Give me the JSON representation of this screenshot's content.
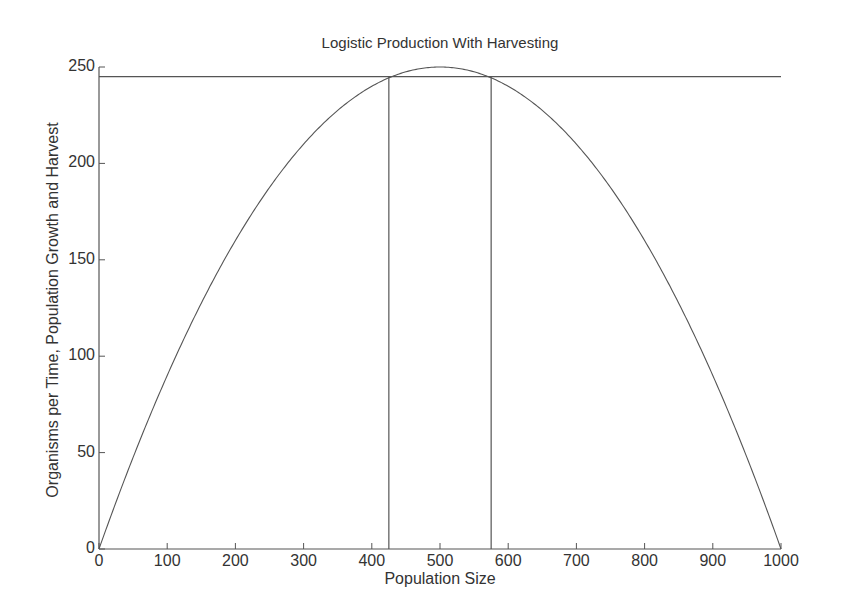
{
  "chart_data": {
    "type": "line",
    "title": "Logistic Production With Harvesting",
    "xlabel": "Population Size",
    "ylabel": "Organisms per Time, Population Growth and Harvest",
    "xlim": [
      0,
      1000
    ],
    "ylim": [
      0,
      250
    ],
    "xticks": [
      0,
      100,
      200,
      300,
      400,
      500,
      600,
      700,
      800,
      900,
      1000
    ],
    "yticks": [
      0,
      50,
      100,
      150,
      200,
      250
    ],
    "grid": false,
    "legend": null,
    "series": [
      {
        "name": "Population Growth (logistic)",
        "formula": "N*(1 - N/1000)",
        "x": [
          0,
          100,
          200,
          300,
          400,
          500,
          600,
          700,
          800,
          900,
          1000
        ],
        "values": [
          0,
          90,
          160,
          210,
          240,
          250,
          240,
          210,
          160,
          90,
          0
        ]
      },
      {
        "name": "Harvest",
        "x": [
          0,
          1000
        ],
        "values": [
          245,
          245
        ]
      }
    ],
    "annotations": [
      {
        "type": "vertical-line",
        "x": 425,
        "from_y": 0,
        "to_y": 245
      },
      {
        "type": "vertical-line",
        "x": 575,
        "from_y": 0,
        "to_y": 245
      }
    ]
  }
}
